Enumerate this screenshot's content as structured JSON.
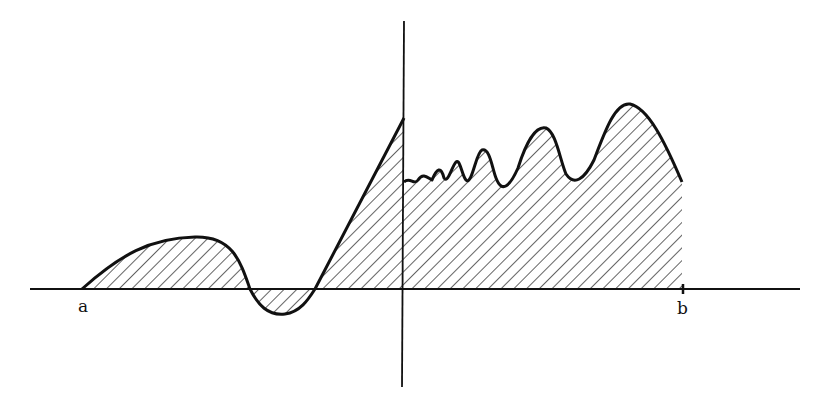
{
  "figure": {
    "labels": {
      "left_bound": "a",
      "right_bound": "b"
    },
    "colors": {
      "ink": "#111111",
      "background": "#ffffff"
    }
  }
}
